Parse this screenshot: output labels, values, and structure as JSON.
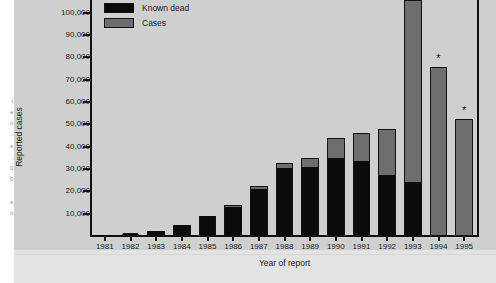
{
  "figure": {
    "background_color": "#cfcfcf",
    "foot_color": "#e3e3e3"
  },
  "page_bleed": {
    "text": "t\ne\nn\n-\ns\n,\n0\n0\n\ns\nn"
  },
  "legend": {
    "items": [
      {
        "label": "Known dead",
        "color": "#0b0b0b",
        "key": "known_dead"
      },
      {
        "label": "Cases",
        "color": "#6e6e6e",
        "key": "cases"
      }
    ]
  },
  "axes": {
    "y_title": "Reported cases",
    "x_title": "Year of report",
    "y_ticks": [
      {
        "value": 10000,
        "label": "10,000"
      },
      {
        "value": 20000,
        "label": "20,000"
      },
      {
        "value": 30000,
        "label": "30,000"
      },
      {
        "value": 40000,
        "label": "40,000"
      },
      {
        "value": 50000,
        "label": "50,000"
      },
      {
        "value": 60000,
        "label": "60,000"
      },
      {
        "value": 70000,
        "label": "70,000"
      },
      {
        "value": 80000,
        "label": "80,000"
      },
      {
        "value": 90000,
        "label": "90,000"
      },
      {
        "value": 100000,
        "label": "100,000"
      }
    ]
  },
  "annotations": {
    "asterisk": "*",
    "asterisk_years": [
      "1994",
      "1995"
    ]
  },
  "chart_data": {
    "type": "bar",
    "subtype": "stacked-vertical",
    "title": "",
    "xlabel": "Year of report",
    "ylabel": "Reported cases",
    "ylim": [
      0,
      105000
    ],
    "y_tick_step": 10000,
    "grid": false,
    "legend_position": "top-left",
    "clipped_note": "The 1993 total bar is cut off by the top edge of the figure",
    "categories": [
      "1981",
      "1982",
      "1983",
      "1984",
      "1985",
      "1986",
      "1987",
      "1988",
      "1989",
      "1990",
      "1991",
      "1992",
      "1993",
      "1994",
      "1995"
    ],
    "series": [
      {
        "name": "Known dead",
        "color": "#0b0b0b",
        "values": [
          400,
          900,
          2000,
          4300,
          8300,
          12500,
          20500,
          30000,
          30500,
          34500,
          33000,
          27000,
          23500,
          0,
          0
        ]
      },
      {
        "name": "Cases",
        "color": "#6e6e6e",
        "values": [
          100,
          200,
          400,
          500,
          500,
          1200,
          1700,
          2700,
          4500,
          9500,
          13000,
          21000,
          82000,
          75500,
          52500
        ]
      }
    ],
    "totals": [
      500,
      1100,
      2400,
      4800,
      8800,
      13700,
      22200,
      32700,
      35000,
      44000,
      46000,
      48000,
      105500,
      75500,
      52500
    ],
    "annotated_points": [
      {
        "category": "1994",
        "marker": "*"
      },
      {
        "category": "1995",
        "marker": "*"
      }
    ]
  }
}
